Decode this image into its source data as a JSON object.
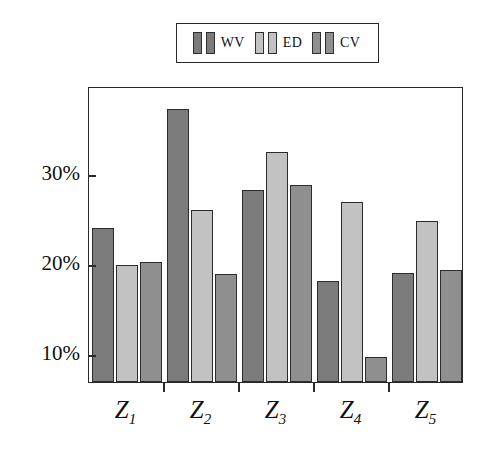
{
  "chart_data": {
    "type": "bar",
    "title": "",
    "xlabel": "",
    "ylabel": "",
    "categories": [
      "Z1",
      "Z2",
      "Z3",
      "Z4",
      "Z5"
    ],
    "category_labels": [
      {
        "base": "Z",
        "sub": "1"
      },
      {
        "base": "Z",
        "sub": "2"
      },
      {
        "base": "Z",
        "sub": "3"
      },
      {
        "base": "Z",
        "sub": "4"
      },
      {
        "base": "Z",
        "sub": "5"
      }
    ],
    "series": [
      {
        "name": "WV",
        "color": "#7b7b7b",
        "values": [
          24.0,
          37.2,
          28.2,
          18.1,
          19.0
        ]
      },
      {
        "name": "ED",
        "color": "#c2c2c2",
        "values": [
          19.9,
          26.0,
          32.5,
          26.9,
          24.8
        ]
      },
      {
        "name": "CV",
        "color": "#8f8f8f",
        "values": [
          20.2,
          18.9,
          28.8,
          9.7,
          19.3
        ]
      }
    ],
    "ylim": [
      6.9,
      39.8
    ],
    "yticks": [
      10,
      20,
      30
    ],
    "ytick_labels": [
      "10%",
      "20%",
      "30%"
    ],
    "grid": false,
    "legend_position": "top-center",
    "value_suffix": "%"
  },
  "legend": {
    "entries": [
      {
        "label": "WV",
        "color": "#7b7b7b"
      },
      {
        "label": "ED",
        "color": "#c2c2c2"
      },
      {
        "label": "CV",
        "color": "#8f8f8f"
      }
    ]
  },
  "colors": {
    "axis": "#2a2a2a",
    "bar_outline": "#2c2c2c",
    "background": "#ffffff",
    "text": "#111111"
  }
}
